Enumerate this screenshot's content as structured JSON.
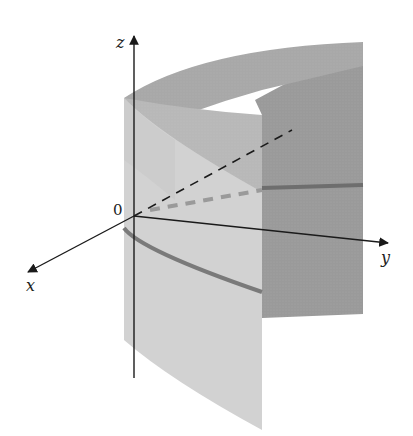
{
  "figure": {
    "labels": {
      "z_axis": "z",
      "y_axis": "y",
      "x_axis": "x",
      "origin": "0"
    },
    "colors": {
      "background": "#ffffff",
      "surface_front": "#cfcfcf",
      "surface_back": "#9a9a9a",
      "surface_inner": "#b4b4b4",
      "curve": "#7a7a7a",
      "axis": "#1a1a1a"
    }
  }
}
